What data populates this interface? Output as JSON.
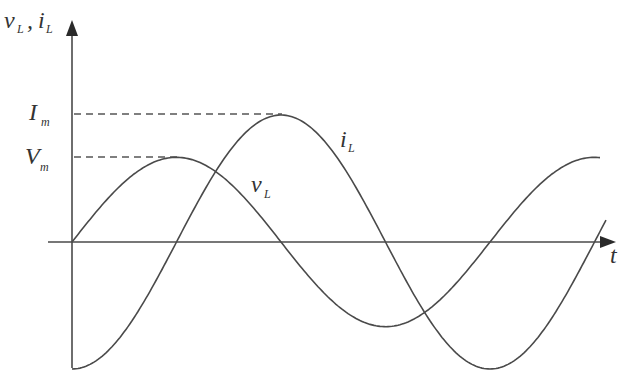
{
  "diagram": {
    "axes": {
      "y_label_main_1": "v",
      "y_label_sub_1": "L",
      "y_label_sep": ",",
      "y_label_main_2": "i",
      "y_label_sub_2": "L",
      "x_label": "t"
    },
    "levels": {
      "current_peak_main": "I",
      "current_peak_sub": "m",
      "voltage_peak_main": "V",
      "voltage_peak_sub": "m"
    },
    "curve_labels": {
      "current_main": "i",
      "current_sub": "L",
      "voltage_main": "v",
      "voltage_sub": "L"
    },
    "colors": {
      "stroke": "#4a4a4a",
      "text": "#333333",
      "background": "#ffffff"
    }
  },
  "chart_data": {
    "type": "line",
    "title": "",
    "xlabel": "t",
    "ylabel": "v_L, i_L",
    "grid": false,
    "series": [
      {
        "name": "v_L",
        "function": "V_m sin(wt)",
        "amplitude_label": "V_m",
        "relative_amplitude": 0.66,
        "phase_deg": 0
      },
      {
        "name": "i_L",
        "function": "-I_m cos(wt)",
        "amplitude_label": "I_m",
        "relative_amplitude": 1.0,
        "phase_deg": -90
      }
    ],
    "x_range_periods": [
      0,
      1.25
    ],
    "annotations": [
      "I_m dashed reference to i_L peak",
      "V_m dashed reference to v_L peak"
    ]
  }
}
